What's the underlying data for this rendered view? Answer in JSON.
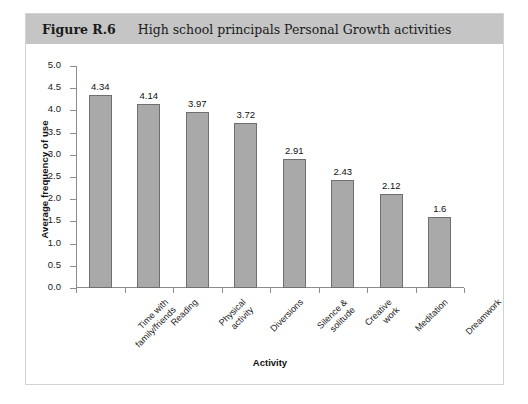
{
  "figure": {
    "number": "Figure R.6",
    "caption": "High school principals Personal Growth activities"
  },
  "colors": {
    "header_band": "#c5c5c5",
    "bar_fill": "#a9a9a9",
    "bar_stroke": "#6f6f6f",
    "axis": "#8d8d8d",
    "panel_border": "#d3d3d3",
    "text": "#111111"
  },
  "chart_data": {
    "type": "bar",
    "title": "High school principals Personal Growth activities",
    "xlabel": "Activity",
    "ylabel": "Average frequency of use",
    "ylim": [
      0,
      5
    ],
    "yticks": [
      "0.0",
      "0.5",
      "1.0",
      "1.5",
      "2.0",
      "2.5",
      "3.0",
      "3.5",
      "4.0",
      "4.5",
      "5.0"
    ],
    "grid": false,
    "legend": "none",
    "categories": [
      "Time with family/friends",
      "Reading",
      "Physical activity",
      "Diversions",
      "Silence & solitude",
      "Creative work",
      "Meditation",
      "Dreamwork"
    ],
    "category_lines": [
      [
        "Time with",
        "family/friends"
      ],
      [
        "Reading"
      ],
      [
        "Physical",
        "activity"
      ],
      [
        "Diversions"
      ],
      [
        "Silence &",
        "solitude"
      ],
      [
        "Creative",
        "work"
      ],
      [
        "Meditation"
      ],
      [
        "Dreamwork"
      ]
    ],
    "values": [
      4.34,
      4.14,
      3.97,
      3.72,
      2.91,
      2.43,
      2.12,
      1.6
    ],
    "value_labels": [
      "4.34",
      "4.14",
      "3.97",
      "3.72",
      "2.91",
      "2.43",
      "2.12",
      "1.6"
    ]
  }
}
